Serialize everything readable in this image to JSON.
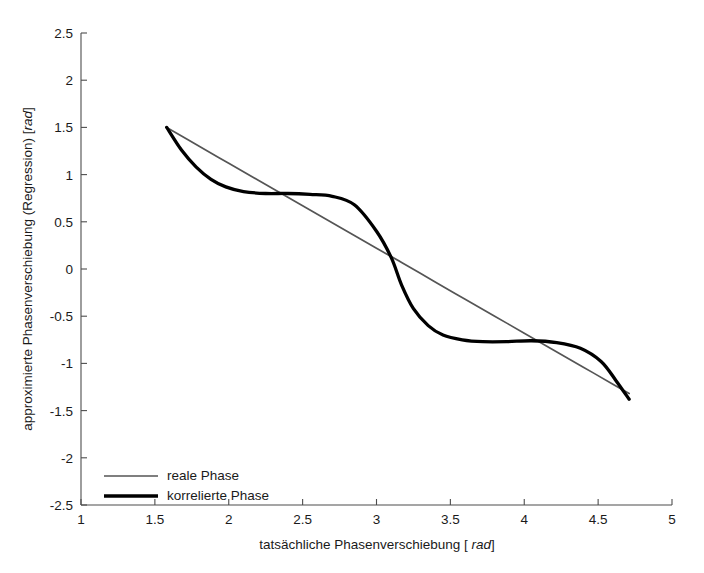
{
  "chart_data": {
    "type": "line",
    "title": "",
    "xlabel_parts": {
      "main": "tatsächliche Phasenverschiebung [ ",
      "unit": "rad",
      "tail": "]"
    },
    "ylabel_parts": {
      "main": "approximierte Phasenverschiebung (Regression) [",
      "unit": "rad",
      "tail": "]"
    },
    "xlabel": "tatsächliche Phasenverschiebung [ rad]",
    "ylabel": "approximierte Phasenverschiebung (Regression) [rad]",
    "xlim": [
      1,
      5
    ],
    "ylim": [
      -2.5,
      2.5
    ],
    "xticks": [
      1,
      1.5,
      2,
      2.5,
      3,
      3.5,
      4,
      4.5,
      5
    ],
    "xtick_labels": [
      "1",
      "1.5",
      "2",
      "2.5",
      "3",
      "3.5",
      "4",
      "4.5",
      "5"
    ],
    "yticks": [
      2.5,
      2,
      1.5,
      1,
      0.5,
      0,
      -0.5,
      -1,
      -1.5,
      -2,
      -2.5
    ],
    "ytick_labels": [
      "2.5",
      "2",
      "1.5",
      "1",
      "0.5",
      "0",
      "-0.5",
      "-1",
      "-1.5",
      "-2",
      "-2.5"
    ],
    "grid": false,
    "legend_position": "lower left",
    "series": [
      {
        "name": "reale Phase",
        "color": "#555555",
        "width": 1.7,
        "x": [
          1.58,
          1.8,
          2.0,
          2.2,
          2.4,
          2.6,
          2.8,
          3.0,
          3.17,
          3.4,
          3.6,
          3.8,
          4.0,
          4.2,
          4.4,
          4.6,
          4.71
        ],
        "y": [
          1.5,
          1.3,
          1.12,
          0.94,
          0.76,
          0.58,
          0.4,
          0.22,
          0.07,
          -0.14,
          -0.32,
          -0.5,
          -0.68,
          -0.86,
          -1.04,
          -1.22,
          -1.32
        ]
      },
      {
        "name": "korrelierte Phase",
        "color": "#000000",
        "width": 3.3,
        "x": [
          1.58,
          1.68,
          1.78,
          1.88,
          1.98,
          2.1,
          2.25,
          2.4,
          2.55,
          2.7,
          2.85,
          3.0,
          3.1,
          3.17,
          3.25,
          3.35,
          3.45,
          3.58,
          3.72,
          3.88,
          4.05,
          4.22,
          4.38,
          4.52,
          4.62,
          4.71
        ],
        "y": [
          1.5,
          1.26,
          1.08,
          0.95,
          0.87,
          0.82,
          0.8,
          0.8,
          0.79,
          0.77,
          0.68,
          0.4,
          0.12,
          -0.17,
          -0.42,
          -0.6,
          -0.7,
          -0.75,
          -0.77,
          -0.77,
          -0.76,
          -0.78,
          -0.84,
          -0.98,
          -1.18,
          -1.38
        ]
      }
    ],
    "legend": [
      {
        "label": "reale Phase",
        "color": "#555555",
        "width": 1.7
      },
      {
        "label": "korrelierte Phase",
        "color": "#000000",
        "width": 3.3
      }
    ]
  },
  "colors": {
    "background": "#ffffff",
    "axis": "#4d4d4d",
    "text": "#1a1a1a",
    "real_phase": "#555555",
    "korrelierte_phase": "#000000"
  }
}
